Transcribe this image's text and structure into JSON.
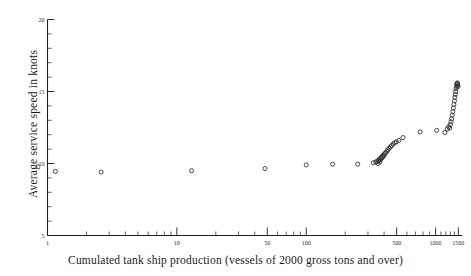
{
  "chart_data": {
    "type": "scatter",
    "title": "",
    "xlabel": "Cumulated tank ship production (vessels of 2000 gross tons and over)",
    "ylabel": "Average service speed in knots",
    "xscale": "log",
    "xlim": [
      1,
      1600
    ],
    "ylim": [
      5,
      20
    ],
    "grid": false,
    "legend": null,
    "marker": "open-circle",
    "xticks_labeled": [
      1,
      10,
      50,
      100,
      500,
      1000,
      1500
    ],
    "xtick_labels": [
      "1",
      "10",
      "50",
      "100",
      "500",
      "1000",
      "1500"
    ],
    "xticks_minor": [
      2,
      3,
      4,
      5,
      6,
      7,
      8,
      9,
      20,
      30,
      40,
      60,
      70,
      80,
      90,
      200,
      300,
      400,
      600,
      700,
      800,
      900,
      1100,
      1200,
      1300,
      1400
    ],
    "yticks_labeled": [
      5,
      10,
      15,
      20
    ],
    "ytick_labels": [
      "5",
      "10",
      "15",
      "20"
    ],
    "yticks_minor": [
      6,
      7,
      8,
      9,
      11,
      12,
      13,
      14,
      16,
      17,
      18,
      19
    ],
    "points": [
      [
        1.15,
        9.45
      ],
      [
        2.6,
        9.4
      ],
      [
        13.0,
        9.5
      ],
      [
        48.0,
        9.65
      ],
      [
        100.0,
        9.9
      ],
      [
        160.0,
        9.95
      ],
      [
        250.0,
        9.95
      ],
      [
        330.0,
        10.05
      ],
      [
        345.0,
        10.1
      ],
      [
        352.0,
        10.15
      ],
      [
        358.0,
        10.0
      ],
      [
        362.0,
        10.2
      ],
      [
        366.0,
        10.3
      ],
      [
        370.0,
        10.1
      ],
      [
        374.0,
        10.25
      ],
      [
        378.0,
        10.4
      ],
      [
        382.0,
        10.35
      ],
      [
        386.0,
        10.5
      ],
      [
        390.0,
        10.45
      ],
      [
        395.0,
        10.6
      ],
      [
        400.0,
        10.55
      ],
      [
        405.0,
        10.7
      ],
      [
        412.0,
        10.75
      ],
      [
        420.0,
        10.85
      ],
      [
        428.0,
        10.95
      ],
      [
        437.0,
        11.05
      ],
      [
        447.0,
        11.15
      ],
      [
        458.0,
        11.25
      ],
      [
        470.0,
        11.35
      ],
      [
        483.0,
        11.45
      ],
      [
        497.0,
        11.5
      ],
      [
        520.0,
        11.6
      ],
      [
        560.0,
        11.8
      ],
      [
        760.0,
        12.2
      ],
      [
        1020.0,
        12.3
      ],
      [
        1180.0,
        12.15
      ],
      [
        1230.0,
        12.4
      ],
      [
        1260.0,
        12.55
      ],
      [
        1285.0,
        12.45
      ],
      [
        1300.0,
        12.7
      ],
      [
        1315.0,
        12.9
      ],
      [
        1330.0,
        13.1
      ],
      [
        1345.0,
        13.35
      ],
      [
        1360.0,
        13.6
      ],
      [
        1372.0,
        13.85
      ],
      [
        1385.0,
        14.1
      ],
      [
        1398.0,
        14.35
      ],
      [
        1410.0,
        14.6
      ],
      [
        1420.0,
        14.8
      ],
      [
        1430.0,
        15.0
      ],
      [
        1440.0,
        15.2
      ],
      [
        1450.0,
        15.35
      ],
      [
        1458.0,
        15.5
      ],
      [
        1466.0,
        15.55
      ],
      [
        1474.0,
        15.6
      ],
      [
        1482.0,
        15.45
      ],
      [
        1490.0,
        15.35
      ]
    ]
  }
}
